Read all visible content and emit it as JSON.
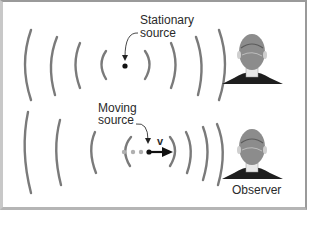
{
  "diagram": {
    "stationary": {
      "label_line1": "Stationary",
      "label_line2": "source"
    },
    "moving": {
      "label_line1": "Moving",
      "label_line2": "source",
      "velocity_label": "v"
    },
    "observer": {
      "label": "Observer"
    },
    "colors": {
      "wave": "#7a7a7a",
      "source": "#111111",
      "trail": "#b0b0b0",
      "text": "#2a2a2a"
    }
  }
}
